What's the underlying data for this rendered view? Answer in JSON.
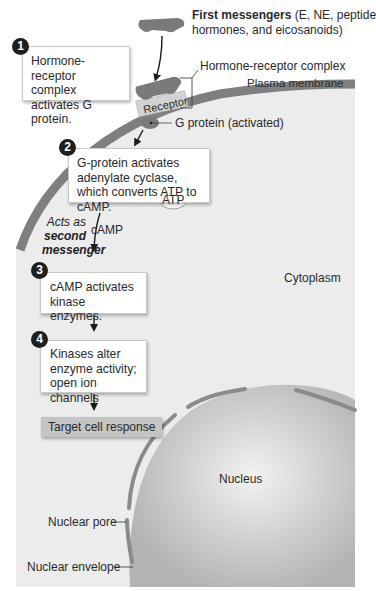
{
  "figure": {
    "first_messengers": {
      "bold": "First messengers",
      "rest_line1": " (E, NE, peptide",
      "line2": "hormones, and eicosanoids)"
    },
    "labels": {
      "hormone_receptor_complex": "Hormone-receptor complex",
      "plasma_membrane": "Plasma membrane",
      "receptor": "Receptor",
      "g_protein": "G protein (activated)",
      "camp": "cAMP",
      "atp": "ATP",
      "cytoplasm": "Cytoplasm",
      "nucleus": "Nucleus",
      "nuclear_pore": "Nuclear pore",
      "nuclear_envelope": "Nuclear envelope",
      "second_messenger": {
        "line1": "Acts as",
        "line2": "second",
        "line3": "messenger"
      }
    },
    "steps": [
      {
        "number": "1",
        "text": "Hormone-receptor complex activates G protein."
      },
      {
        "number": "2",
        "text": "G-protein activates adenylate cyclase, which converts ATP to cAMP."
      },
      {
        "number": "3",
        "text": "cAMP activates kinase enzymes."
      },
      {
        "number": "4",
        "text": "Kinases alter enzyme activity; open ion channels"
      }
    ],
    "response": "Target cell response",
    "colors": {
      "cytoplasm": "#e9e9e9",
      "membrane": "#7d7d7d",
      "nucleus": "#bdbdbd",
      "messenger": "#7a7a7a",
      "receptor": "#cfcfcf"
    }
  }
}
